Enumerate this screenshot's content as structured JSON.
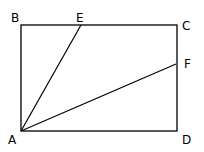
{
  "diagram": {
    "type": "geometry",
    "shape": "rectangle ABCD with segments AE and AF",
    "points": {
      "A": {
        "label": "A",
        "x": 21,
        "y": 131,
        "lx": 8,
        "ly": 144
      },
      "B": {
        "label": "B",
        "x": 21,
        "y": 25,
        "lx": 11,
        "ly": 22
      },
      "C": {
        "label": "C",
        "x": 177,
        "y": 25,
        "lx": 182,
        "ly": 30
      },
      "D": {
        "label": "D",
        "x": 177,
        "y": 131,
        "lx": 182,
        "ly": 144
      },
      "E": {
        "label": "E",
        "x": 81,
        "y": 25,
        "lx": 76,
        "ly": 22
      },
      "F": {
        "label": "F",
        "x": 176,
        "y": 64,
        "lx": 184,
        "ly": 68
      }
    },
    "segments": [
      [
        "A",
        "B"
      ],
      [
        "B",
        "C"
      ],
      [
        "C",
        "D"
      ],
      [
        "D",
        "A"
      ],
      [
        "A",
        "E"
      ],
      [
        "A",
        "F"
      ]
    ],
    "stroke_color": "#000000"
  }
}
